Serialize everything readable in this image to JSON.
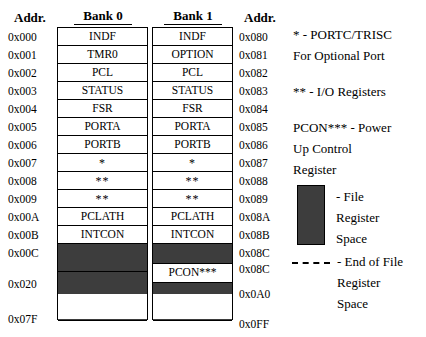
{
  "headers": {
    "addr_left": "Addr.",
    "bank0": "Bank 0",
    "bank1": "Bank 1",
    "addr_right": "Addr."
  },
  "addresses_left": [
    "0x000",
    "0x001",
    "0x002",
    "0x003",
    "0x004",
    "0x005",
    "0x006",
    "0x007",
    "0x008",
    "0x009",
    "0x00A",
    "0x00B",
    "0x00C",
    "0x020",
    "0x07F"
  ],
  "addresses_right": [
    "0x080",
    "0x081",
    "0x082",
    "0x083",
    "0x084",
    "0x085",
    "0x086",
    "0x087",
    "0x088",
    "0x089",
    "0x08A",
    "0x08B",
    "0x08C",
    "0x08C",
    "0x0A0",
    "0x0FF"
  ],
  "bank0": {
    "rows": [
      {
        "label": "INDF",
        "kind": "register"
      },
      {
        "label": "TMR0",
        "kind": "register"
      },
      {
        "label": "PCL",
        "kind": "register"
      },
      {
        "label": "STATUS",
        "kind": "register"
      },
      {
        "label": "FSR",
        "kind": "register"
      },
      {
        "label": "PORTA",
        "kind": "register"
      },
      {
        "label": "PORTB",
        "kind": "register"
      },
      {
        "label": "*",
        "kind": "register"
      },
      {
        "label": "**",
        "kind": "register"
      },
      {
        "label": "**",
        "kind": "register"
      },
      {
        "label": "PCLATH",
        "kind": "register"
      },
      {
        "label": "INTCON",
        "kind": "register"
      },
      {
        "label": "",
        "kind": "shaded"
      },
      {
        "label": "",
        "kind": "shaded"
      },
      {
        "label": "",
        "kind": "empty"
      }
    ]
  },
  "bank1": {
    "rows": [
      {
        "label": "INDF",
        "kind": "register"
      },
      {
        "label": "OPTION",
        "kind": "register"
      },
      {
        "label": "PCL",
        "kind": "register"
      },
      {
        "label": "STATUS",
        "kind": "register"
      },
      {
        "label": "FSR",
        "kind": "register"
      },
      {
        "label": "PORTA",
        "kind": "register"
      },
      {
        "label": "PORTB",
        "kind": "register"
      },
      {
        "label": "*",
        "kind": "register"
      },
      {
        "label": "**",
        "kind": "register"
      },
      {
        "label": "**",
        "kind": "register"
      },
      {
        "label": "PCLATH",
        "kind": "register"
      },
      {
        "label": "INTCON",
        "kind": "register"
      },
      {
        "label": "",
        "kind": "shaded"
      },
      {
        "label": "PCON***",
        "kind": "register"
      },
      {
        "label": "",
        "kind": "shaded"
      },
      {
        "label": "",
        "kind": "empty"
      }
    ]
  },
  "legend": {
    "note_star_line1": "* - PORTC/TRISC",
    "note_star_line2": "For Optional Port",
    "note_double_star": "** - I/O Registers",
    "note_pcon_line1": "PCON*** - Power",
    "note_pcon_line2": "Up Control",
    "note_pcon_line3": "Register",
    "swatch_line1": "- File",
    "swatch_line2": "Register",
    "swatch_line3": "Space",
    "dash_line1": "- End of File",
    "dash_line2": "Register",
    "dash_line3": "Space"
  },
  "colors": {
    "file_register_space": "#3d3d3d",
    "background": "#ffffff",
    "outline": "#000000"
  }
}
